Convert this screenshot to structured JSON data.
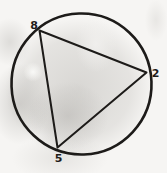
{
  "figure": {
    "vertex_labels": {
      "top_left": "8",
      "right": "2",
      "bottom": "5"
    },
    "colors": {
      "ink": "#1d1b19",
      "paper": "#f6f5f3"
    }
  }
}
